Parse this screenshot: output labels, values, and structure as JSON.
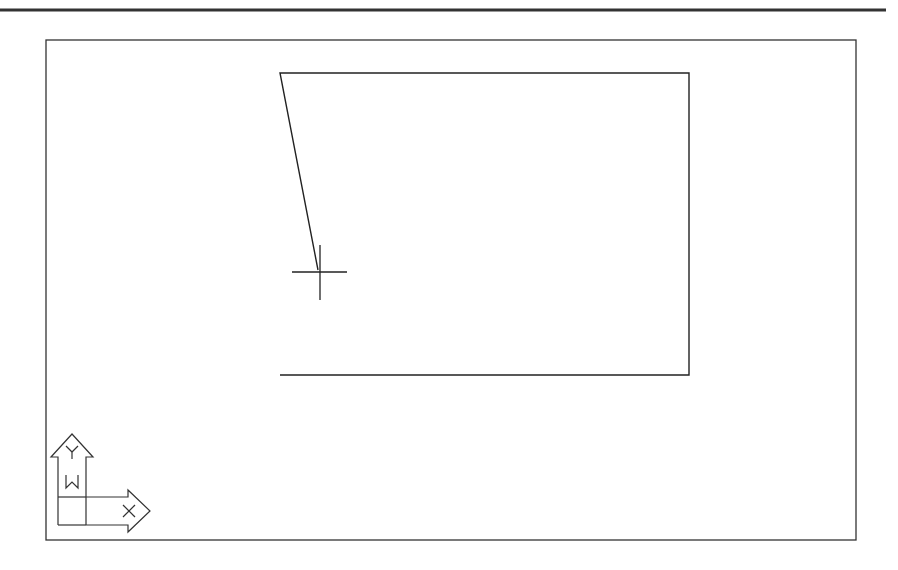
{
  "app": {
    "type": "CAD drawing viewport"
  },
  "viewport": {
    "background": "#ffffff",
    "line_color": "#222222",
    "frame": {
      "x1": 46,
      "y1": 40,
      "x2": 856,
      "y2": 540
    },
    "top_rule": {
      "x1": 0,
      "y1": 10,
      "x2": 886,
      "y2": 10
    }
  },
  "drawing": {
    "polyline": [
      [
        280,
        375
      ],
      [
        689,
        375
      ],
      [
        689,
        73
      ],
      [
        280,
        73
      ],
      [
        318,
        270
      ]
    ]
  },
  "cursor": {
    "type": "crosshair",
    "x": 320,
    "y": 272,
    "h_extent": [
      292,
      347
    ],
    "v_extent": [
      245,
      300
    ]
  },
  "ucs_icon": {
    "y_label": "Y",
    "x_label": "X",
    "w_label": "W"
  }
}
